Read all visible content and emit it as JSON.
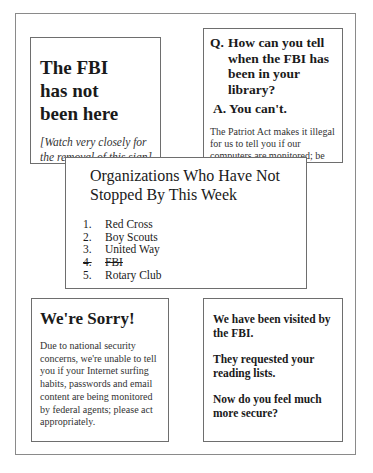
{
  "top_left": {
    "title_lines": [
      "The FBI",
      "has not",
      "been here"
    ],
    "note": "[Watch very closely for the removal of this sign]"
  },
  "top_right": {
    "question_prefix": "Q.",
    "question": "How can you tell when the FBI has been in your library?",
    "answer": "A. You can't.",
    "body": "The Patriot Act makes it illegal for us to tell you if our computers are monitored; be aware!"
  },
  "middle": {
    "title": "Organizations Who Have Not Stopped By This Week",
    "items": [
      {
        "num": "1.",
        "label": "Red Cross",
        "struck": false
      },
      {
        "num": "2.",
        "label": "Boy Scouts",
        "struck": false
      },
      {
        "num": "3.",
        "label": "United Way",
        "struck": false
      },
      {
        "num": "4.",
        "label": "FBI",
        "struck": true
      },
      {
        "num": "5.",
        "label": "Rotary Club",
        "struck": false
      }
    ]
  },
  "bottom_left": {
    "title": "We're Sorry!",
    "body": "Due to national security concerns, we're unable to tell you if your Internet surfing habits, passwords and email content are being monitored by federal agents; please act appropriately."
  },
  "bottom_right": {
    "paragraphs": [
      "We have been visited by the FBI.",
      "They requested your reading lists.",
      "Now do you feel much more secure?"
    ]
  }
}
